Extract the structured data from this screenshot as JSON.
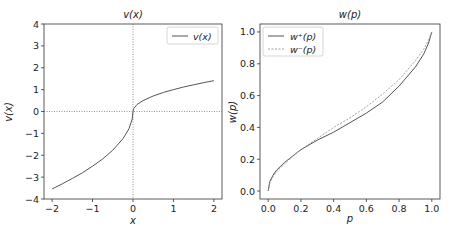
{
  "chart_data": [
    {
      "type": "line",
      "title": "v(x)",
      "xlabel": "x",
      "ylabel": "v(x)",
      "xlim": [
        -2.2,
        2.2
      ],
      "ylim": [
        -4,
        4
      ],
      "xticks": [
        "−2",
        "−1",
        "0",
        "1",
        "2"
      ],
      "yticks": [
        "−4",
        "−3",
        "−2",
        "−1",
        "0",
        "1",
        "2",
        "3",
        "4"
      ],
      "grid": false,
      "reference_lines": {
        "vertical_x": 0,
        "horizontal_y": 0,
        "style": "dotted"
      },
      "legend": {
        "position": "upper right",
        "entries": [
          "v(x)"
        ]
      },
      "series": [
        {
          "name": "v(x)",
          "style": "solid",
          "x": [
            -2.0,
            -1.75,
            -1.5,
            -1.25,
            -1.0,
            -0.75,
            -0.5,
            -0.25,
            -0.1,
            -0.02,
            0.0,
            0.02,
            0.1,
            0.25,
            0.5,
            0.75,
            1.0,
            1.25,
            1.5,
            1.75,
            2.0
          ],
          "values": [
            -3.54,
            -3.31,
            -3.06,
            -2.8,
            -2.5,
            -2.17,
            -1.77,
            -1.25,
            -0.79,
            -0.35,
            0.0,
            0.14,
            0.32,
            0.5,
            0.71,
            0.87,
            1.0,
            1.12,
            1.22,
            1.32,
            1.41
          ]
        }
      ]
    },
    {
      "type": "line",
      "title": "w(p)",
      "xlabel": "p",
      "ylabel": "w(p)",
      "xlim": [
        -0.05,
        1.05
      ],
      "ylim": [
        -0.05,
        1.05
      ],
      "xticks": [
        "0.0",
        "0.2",
        "0.4",
        "0.6",
        "0.8",
        "1.0"
      ],
      "yticks": [
        "0.0",
        "0.2",
        "0.4",
        "0.6",
        "0.8",
        "1.0"
      ],
      "grid": false,
      "legend": {
        "position": "upper left",
        "entries": [
          "w⁺(p)",
          "w⁻(p)"
        ]
      },
      "series": [
        {
          "name": "w⁺(p)",
          "style": "solid",
          "x": [
            0.0,
            0.01,
            0.03,
            0.05,
            0.1,
            0.15,
            0.2,
            0.3,
            0.4,
            0.5,
            0.6,
            0.7,
            0.8,
            0.9,
            0.95,
            0.98,
            1.0
          ],
          "values": [
            0.0,
            0.06,
            0.1,
            0.13,
            0.18,
            0.22,
            0.26,
            0.32,
            0.37,
            0.43,
            0.49,
            0.56,
            0.66,
            0.78,
            0.86,
            0.93,
            1.0
          ]
        },
        {
          "name": "w⁻(p)",
          "style": "dashed",
          "x": [
            0.0,
            0.01,
            0.03,
            0.05,
            0.1,
            0.15,
            0.2,
            0.3,
            0.4,
            0.5,
            0.6,
            0.7,
            0.8,
            0.9,
            0.95,
            0.98,
            1.0
          ],
          "values": [
            0.0,
            0.05,
            0.09,
            0.12,
            0.17,
            0.22,
            0.26,
            0.33,
            0.4,
            0.46,
            0.53,
            0.61,
            0.7,
            0.82,
            0.89,
            0.95,
            1.0
          ]
        }
      ]
    }
  ]
}
